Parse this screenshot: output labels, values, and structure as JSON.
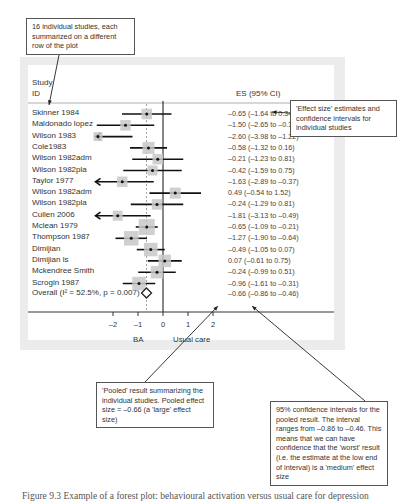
{
  "callouts": {
    "top_left": "16 individual studies, each summarized on a different row of the plot",
    "right": "'Effect size' estimates and confidence intervals for individual studies",
    "pooled": "'Pooled' result summarizing the individual studies. Pooled effect size = –0.66 (a 'large' effect size)",
    "interval": "95% confidence intervals for the pooled result. The interval ranges from –0.86 to –0.46. This means that we can have confidence that the 'worst' result (i.e. the estimate at the low end of interval) is a 'medium' effect size"
  },
  "header": {
    "study_line1": "Study",
    "study_line2": "ID",
    "es": "ES (95% CI)"
  },
  "studies": [
    {
      "label": "Skinner 1984",
      "es": "–0.65 (–1.64 to 0.34)"
    },
    {
      "label": "Maldonado lopez",
      "es": "–1.50 (–2.65 to –0.35)"
    },
    {
      "label": "Wilson 1983",
      "es": "–2.60 (–3.98 to –1.22)"
    },
    {
      "label": "Cole1983",
      "es": "–0.58 (–1.32 to 0.16)"
    },
    {
      "label": "Wilson 1982adm",
      "es": "–0.21 (–1.23 to 0.81)"
    },
    {
      "label": "Wilson 1982pla",
      "es": "–0.42 (–1.59 to 0.75)"
    },
    {
      "label": "Taylor 1977",
      "es": "–1.63 (–2.89 to –0.37)"
    },
    {
      "label": "Wilson 1982adm",
      "es": "0.49 (–0.54 to 1.52)"
    },
    {
      "label": "Wilson  1982pla",
      "es": "–0.24 (–1.29 to 0.81)"
    },
    {
      "label": "Cullen 2006",
      "es": "–1.81 (–3.13 to –0.49)"
    },
    {
      "label": "Mclean 1979",
      "es": "–0.65 (–1.09 to –0.21)"
    },
    {
      "label": "Thompson 1987",
      "es": "–1.27 (–1.90 to –0.64)"
    },
    {
      "label": "Dimijian",
      "es": "–0.49 (–1.05 to 0.07)"
    },
    {
      "label": "Dimijian ls",
      "es": "0.07 (–0.61 to 0.75)"
    },
    {
      "label": "Mckendree Smith",
      "es": "–0.24 (–0.99 to 0.51)"
    },
    {
      "label": "Scrogin 1987",
      "es": "–0.96 (–1.61 to –0.31)"
    }
  ],
  "overall": {
    "label": "Overall  (I² = 52.5%, p = 0.007)",
    "es": "–0.66 (–0.86 to –0.46)"
  },
  "axis": {
    "ticks": [
      "–2",
      "–1",
      "0",
      "1",
      "2"
    ],
    "left_label": "BA",
    "right_label": "Usual care"
  },
  "caption": "Figure 9.3  Example of a forest plot: behavioural activation versus usual care for depression",
  "chart_data": {
    "type": "forest",
    "title": "",
    "xlabel_left": "BA",
    "xlabel_right": "Usual care",
    "column_headers": [
      "Study ID",
      "ES (95% CI)"
    ],
    "x_ticks": [
      -2,
      -1,
      0,
      1,
      2
    ],
    "xlim": [
      -2.7,
      2.7
    ],
    "reference_line": 0,
    "pooled_line": -0.66,
    "studies": [
      {
        "name": "Skinner 1984",
        "es": -0.65,
        "lo": -1.64,
        "hi": 0.34
      },
      {
        "name": "Maldonado lopez",
        "es": -1.5,
        "lo": -2.65,
        "hi": -0.35
      },
      {
        "name": "Wilson 1983",
        "es": -2.6,
        "lo": -3.98,
        "hi": -1.22
      },
      {
        "name": "Cole1983",
        "es": -0.58,
        "lo": -1.32,
        "hi": 0.16
      },
      {
        "name": "Wilson 1982adm",
        "es": -0.21,
        "lo": -1.23,
        "hi": 0.81
      },
      {
        "name": "Wilson 1982pla",
        "es": -0.42,
        "lo": -1.59,
        "hi": 0.75
      },
      {
        "name": "Taylor 1977",
        "es": -1.63,
        "lo": -2.89,
        "hi": -0.37
      },
      {
        "name": "Wilson 1982adm",
        "es": 0.49,
        "lo": -0.54,
        "hi": 1.52
      },
      {
        "name": "Wilson 1982pla",
        "es": -0.24,
        "lo": -1.29,
        "hi": 0.81
      },
      {
        "name": "Cullen 2006",
        "es": -1.81,
        "lo": -3.13,
        "hi": -0.49
      },
      {
        "name": "Mclean 1979",
        "es": -0.65,
        "lo": -1.09,
        "hi": -0.21
      },
      {
        "name": "Thompson 1987",
        "es": -1.27,
        "lo": -1.9,
        "hi": -0.64
      },
      {
        "name": "Dimijian",
        "es": -0.49,
        "lo": -1.05,
        "hi": 0.07
      },
      {
        "name": "Dimijian ls",
        "es": 0.07,
        "lo": -0.61,
        "hi": 0.75
      },
      {
        "name": "Mckendree Smith",
        "es": -0.24,
        "lo": -0.99,
        "hi": 0.51
      },
      {
        "name": "Scrogin 1987",
        "es": -0.96,
        "lo": -1.61,
        "hi": -0.31
      }
    ],
    "overall": {
      "name": "Overall",
      "es": -0.66,
      "lo": -0.86,
      "hi": -0.46,
      "I2": "52.5%",
      "p": 0.007
    }
  }
}
